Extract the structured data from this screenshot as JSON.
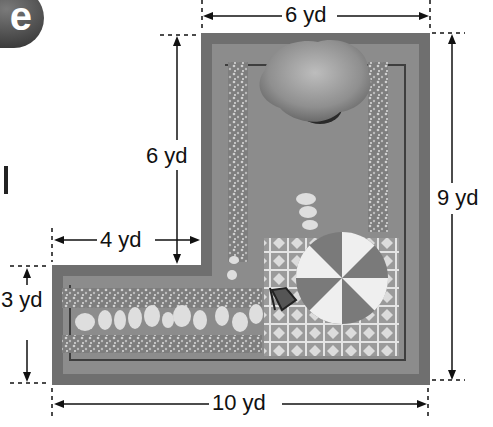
{
  "figure": {
    "badge_letter": "e",
    "stray_glyph": "l",
    "dimensions": {
      "top_width": "6 yd",
      "inner_height": "6 yd",
      "left_width": "4 yd",
      "left_height": "3 yd",
      "bottom_width": "10 yd",
      "right_height": "9 yd"
    },
    "colors": {
      "ground": "#8a8a8a",
      "border": "#6e6e6e",
      "gravel": "#b4b4b4",
      "stone": "#e0e0e0",
      "tile": "#d8d8d8",
      "umbrella_light": "#efefef",
      "umbrella_dark": "#7a7a7a",
      "tree": "#a8a8a8"
    }
  }
}
